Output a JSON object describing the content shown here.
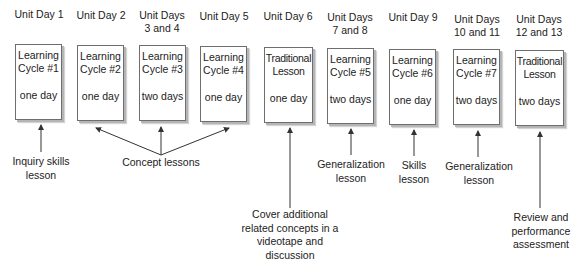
{
  "diagram": {
    "columns": [
      {
        "header": [
          "Unit Day 1"
        ],
        "box_title": [
          "Learning",
          "Cycle #1"
        ],
        "duration": "one day"
      },
      {
        "header": [
          "Unit Day 2"
        ],
        "box_title": [
          "Learning",
          "Cycle #2"
        ],
        "duration": "one day"
      },
      {
        "header": [
          "Unit Days",
          "3 and 4"
        ],
        "box_title": [
          "Learning",
          "Cycle #3"
        ],
        "duration": "two days"
      },
      {
        "header": [
          "Unit Day 5"
        ],
        "box_title": [
          "Learning",
          "Cycle #4"
        ],
        "duration": "one day"
      },
      {
        "header": [
          "Unit Day 6"
        ],
        "box_title": [
          "Traditional",
          "Lesson"
        ],
        "duration": "one day"
      },
      {
        "header": [
          "Unit Days",
          "7 and 8"
        ],
        "box_title": [
          "Learning",
          "Cycle #5"
        ],
        "duration": "two days"
      },
      {
        "header": [
          "Unit Day 9"
        ],
        "box_title": [
          "Learning",
          "Cycle #6"
        ],
        "duration": "one day"
      },
      {
        "header": [
          "Unit Days",
          "10 and 11"
        ],
        "box_title": [
          "Learning",
          "Cycle #7"
        ],
        "duration": "two days"
      },
      {
        "header": [
          "Unit Days",
          "12 and 13"
        ],
        "box_title": [
          "Traditional",
          "Lesson"
        ],
        "duration": "two days"
      }
    ],
    "annotations": [
      {
        "id": "inquiry",
        "lines": [
          "Inquiry skills",
          "lesson"
        ],
        "points_to": [
          1
        ]
      },
      {
        "id": "concept",
        "lines": [
          "Concept lessons"
        ],
        "points_to": [
          2,
          3,
          4
        ]
      },
      {
        "id": "videotape",
        "lines": [
          "Cover additional",
          "related concepts in a",
          "videotape and",
          "discussion"
        ],
        "points_to": [
          5
        ]
      },
      {
        "id": "generalization-1",
        "lines": [
          "Generalization",
          "lesson"
        ],
        "points_to": [
          6
        ]
      },
      {
        "id": "skills",
        "lines": [
          "Skills",
          "lesson"
        ],
        "points_to": [
          7
        ]
      },
      {
        "id": "generalization-2",
        "lines": [
          "Generalization",
          "lesson"
        ],
        "points_to": [
          8
        ]
      },
      {
        "id": "review",
        "lines": [
          "Review and",
          "performance",
          "assessment"
        ],
        "points_to": [
          9
        ]
      }
    ],
    "colors": {
      "box_border": "#6e6e6e",
      "box_shadow": "#b5b5b5",
      "arrow": "#333333",
      "text": "#222222"
    }
  }
}
